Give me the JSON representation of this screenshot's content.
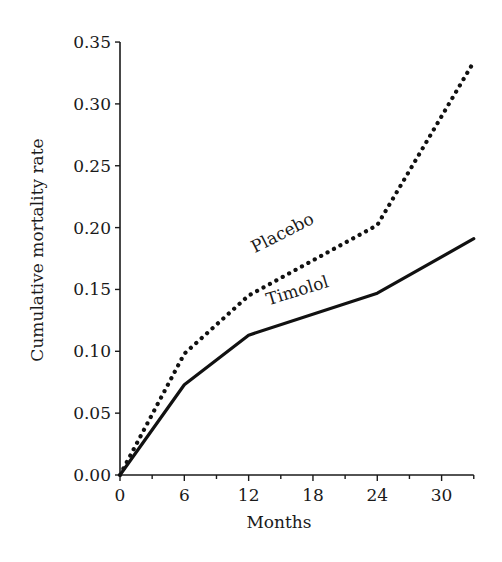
{
  "chart_data": {
    "type": "line",
    "title": "",
    "xlabel": "Months",
    "ylabel": "Cumulative mortality rate",
    "xlim": [
      0,
      33
    ],
    "ylim": [
      0,
      0.35
    ],
    "x_ticks": [
      "0",
      "6",
      "12",
      "18",
      "24",
      "30"
    ],
    "y_ticks": [
      "0.00",
      "0.05",
      "0.10",
      "0.15",
      "0.20",
      "0.25",
      "0.30",
      "0.35"
    ],
    "grid": false,
    "legend": "inline labels on lines",
    "series": [
      {
        "name": "Placebo",
        "style": "dotted",
        "x": [
          0,
          6,
          12,
          24,
          33
        ],
        "values": [
          0.0,
          0.098,
          0.145,
          0.202,
          0.334
        ]
      },
      {
        "name": "Timolol",
        "style": "solid",
        "x": [
          0,
          6,
          12,
          24,
          33
        ],
        "values": [
          0.0,
          0.073,
          0.113,
          0.147,
          0.191
        ]
      }
    ]
  },
  "labels": {
    "placebo": "Placebo",
    "timolol": "Timolol"
  },
  "colors": {
    "line": "#111111",
    "axis": "#1a1a1a",
    "background": "#ffffff"
  }
}
